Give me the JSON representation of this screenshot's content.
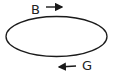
{
  "diagram": {
    "shape": "ellipse",
    "stroke_color": "#1a1a1a",
    "labels": [
      {
        "id": "top",
        "text": "B",
        "arrow_direction": "right",
        "position": "above ellipse"
      },
      {
        "id": "bottom",
        "text": "G",
        "arrow_direction": "left",
        "position": "below ellipse"
      }
    ]
  }
}
